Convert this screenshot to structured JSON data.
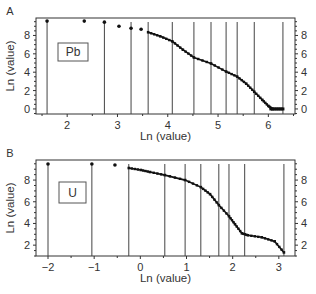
{
  "chart_data": [
    {
      "type": "scatter",
      "panel_label": "A",
      "element_label": "Pb",
      "xlabel": "Ln (value)",
      "ylabel": "Ln (value)",
      "xlim": [
        1.38,
        6.53
      ],
      "ylim": [
        -0.55,
        9.9
      ],
      "xticks": [
        2,
        3,
        4,
        5,
        6
      ],
      "yticks": [
        0,
        2,
        4,
        6,
        8
      ],
      "right_yticks": [
        0,
        2,
        4,
        6,
        8
      ],
      "grid": false,
      "threshold_lines_x": [
        1.6,
        2.74,
        3.27,
        3.61,
        4.09,
        4.52,
        4.86,
        5.16,
        5.38,
        5.72,
        6.29
      ],
      "isolated_points": [
        {
          "x": 1.6,
          "y": 9.56
        },
        {
          "x": 2.34,
          "y": 9.56
        },
        {
          "x": 2.74,
          "y": 9.45
        },
        {
          "x": 3.03,
          "y": 9.01
        },
        {
          "x": 3.27,
          "y": 8.79
        },
        {
          "x": 3.47,
          "y": 8.68
        }
      ],
      "curve": [
        {
          "x": 3.61,
          "y": 8.35
        },
        {
          "x": 3.85,
          "y": 7.91
        },
        {
          "x": 4.09,
          "y": 7.36
        },
        {
          "x": 4.3,
          "y": 6.45
        },
        {
          "x": 4.52,
          "y": 5.6
        },
        {
          "x": 4.86,
          "y": 4.95
        },
        {
          "x": 5.16,
          "y": 4.07
        },
        {
          "x": 5.38,
          "y": 3.52
        },
        {
          "x": 5.56,
          "y": 2.75
        },
        {
          "x": 5.72,
          "y": 1.87
        },
        {
          "x": 5.88,
          "y": 0.99
        },
        {
          "x": 6.0,
          "y": 0.33
        },
        {
          "x": 6.08,
          "y": 0.0
        }
      ],
      "zero_points": [
        6.05,
        6.09,
        6.13,
        6.17,
        6.21,
        6.25,
        6.29
      ]
    },
    {
      "type": "scatter",
      "panel_label": "B",
      "element_label": "U",
      "xlabel": "Ln (value)",
      "ylabel": "Ln (value)",
      "xlim": [
        -2.26,
        3.35
      ],
      "ylim": [
        1.0,
        9.85
      ],
      "xticks": [
        -2,
        -1,
        0,
        1,
        2,
        3
      ],
      "yticks": [
        2,
        4,
        6,
        8
      ],
      "right_yticks": [
        2,
        4,
        6,
        8
      ],
      "grid": false,
      "threshold_lines_x": [
        -2.0,
        -1.05,
        -0.25,
        0.53,
        0.97,
        1.31,
        1.7,
        1.92,
        2.26,
        3.11
      ],
      "isolated_points": [
        {
          "x": -2.0,
          "y": 9.48
        },
        {
          "x": -1.05,
          "y": 9.48
        },
        {
          "x": -0.55,
          "y": 9.39
        }
      ],
      "curve": [
        {
          "x": -0.25,
          "y": 9.11
        },
        {
          "x": 0.01,
          "y": 8.93
        },
        {
          "x": 0.21,
          "y": 8.74
        },
        {
          "x": 0.53,
          "y": 8.46
        },
        {
          "x": 0.97,
          "y": 8.0
        },
        {
          "x": 1.31,
          "y": 7.35
        },
        {
          "x": 1.51,
          "y": 6.7
        },
        {
          "x": 1.7,
          "y": 5.69
        },
        {
          "x": 1.92,
          "y": 4.67
        },
        {
          "x": 2.05,
          "y": 3.93
        },
        {
          "x": 2.2,
          "y": 3.09
        },
        {
          "x": 2.33,
          "y": 2.91
        },
        {
          "x": 2.63,
          "y": 2.72
        },
        {
          "x": 2.91,
          "y": 2.35
        },
        {
          "x": 3.11,
          "y": 1.33
        }
      ]
    }
  ]
}
